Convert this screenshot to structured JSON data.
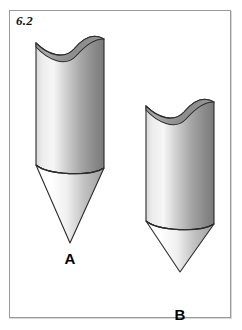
{
  "figure": {
    "number": "6.2",
    "frame": {
      "border_color": "#9a9a9a",
      "background_color": "#ffffff"
    },
    "shapes": [
      {
        "id": "shape-a",
        "label": "A",
        "description": "cylinder with wavy saddle-cut top tapering into a long narrow cone",
        "body": "cylinder",
        "top_cut": "wavy-saddle",
        "bottom": "cone",
        "cylinder_height_px": 140,
        "cone_height_px": 78,
        "width_px": 68,
        "fill_light": "#f4f4f4",
        "fill_mid": "#bdbdbd",
        "fill_dark": "#6f6f6f",
        "outline_color": "#2b2b2b"
      },
      {
        "id": "shape-b",
        "label": "B",
        "description": "cylinder with wavy saddle-cut top tapering into a short wide cone",
        "body": "cylinder",
        "top_cut": "wavy-saddle",
        "bottom": "cone",
        "cylinder_height_px": 112,
        "cone_height_px": 50,
        "width_px": 68,
        "fill_light": "#f4f4f4",
        "fill_mid": "#bdbdbd",
        "fill_dark": "#6f6f6f",
        "outline_color": "#2b2b2b"
      }
    ]
  }
}
